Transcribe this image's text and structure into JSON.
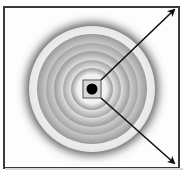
{
  "diagram": {
    "type": "concentric-rings-with-arrows",
    "frame": {
      "border_color": "#3a3a3a",
      "background": "#fdfdfd"
    },
    "center": {
      "x": 92,
      "y": 89
    },
    "rings": [
      {
        "r": 64,
        "color": "#ffffff"
      },
      {
        "r": 56,
        "color": "#cfcfcf"
      },
      {
        "r": 47,
        "color": "#e8e8e8"
      },
      {
        "r": 40,
        "color": "#bdbdbd"
      },
      {
        "r": 31,
        "color": "#dcdcdc"
      },
      {
        "r": 23,
        "color": "#b8b8b8"
      },
      {
        "r": 16,
        "color": "#f3f3f3"
      }
    ],
    "center_square": {
      "size": 18,
      "fill": "#d9d9d9",
      "border": "#555555"
    },
    "center_dot": {
      "r": 5,
      "color": "#000000"
    },
    "arrows": [
      {
        "name": "arrow-up-right",
        "x1": 100,
        "y1": 80,
        "x2": 175,
        "y2": 9
      },
      {
        "name": "arrow-down-right",
        "x1": 100,
        "y1": 97,
        "x2": 175,
        "y2": 163
      }
    ],
    "arrow_color": "#111111"
  }
}
